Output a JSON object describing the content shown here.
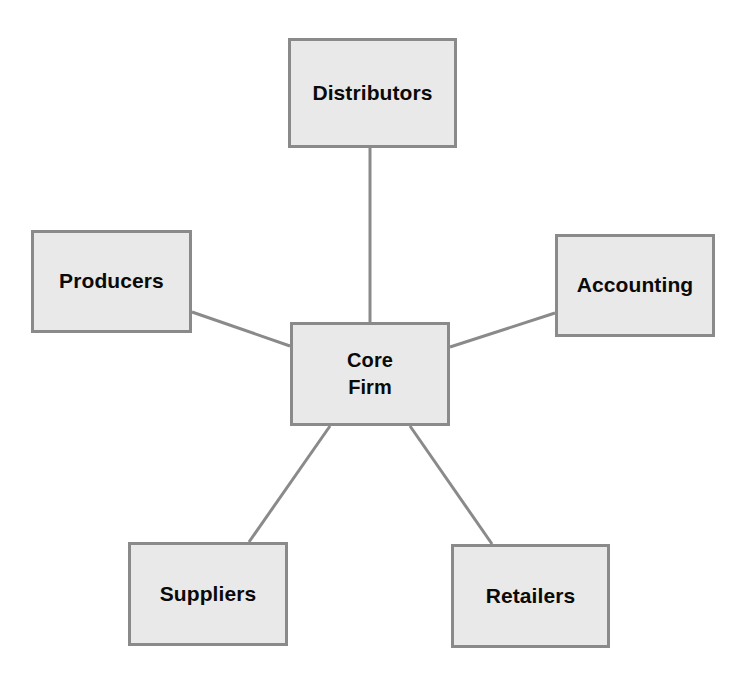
{
  "diagram": {
    "type": "hub-and-spoke network diagram",
    "background_color": "#ffffff",
    "node_fill_color": "#e9e9e9",
    "node_border_color": "#8a8a8a",
    "connector_color": "#8a8a8a",
    "text_color": "#0a0a0a",
    "nodes": [
      {
        "id": "distributors",
        "label": "Distributors",
        "x": 288,
        "y": 38,
        "width": 169,
        "height": 110
      },
      {
        "id": "producers",
        "label": "Producers",
        "x": 31,
        "y": 230,
        "width": 161,
        "height": 103
      },
      {
        "id": "accounting",
        "label": "Accounting",
        "x": 555,
        "y": 234,
        "width": 160,
        "height": 103
      },
      {
        "id": "core-firm",
        "label": "Core\nFirm",
        "x": 290,
        "y": 322,
        "width": 160,
        "height": 104
      },
      {
        "id": "suppliers",
        "label": "Suppliers",
        "x": 128,
        "y": 542,
        "width": 160,
        "height": 104
      },
      {
        "id": "retailers",
        "label": "Retailers",
        "x": 451,
        "y": 544,
        "width": 159,
        "height": 104
      }
    ],
    "connectors": [
      {
        "id": "core-firm-to-distributors",
        "from": "core-firm",
        "to": "distributors",
        "x1": 370,
        "y1": 322,
        "x2": 370,
        "y2": 148
      },
      {
        "id": "producers-to-core-firm",
        "from": "producers",
        "to": "core-firm",
        "x1": 192,
        "y1": 312,
        "x2": 290,
        "y2": 346
      },
      {
        "id": "core-firm-to-accounting",
        "from": "core-firm",
        "to": "accounting",
        "x1": 450,
        "y1": 347,
        "x2": 555,
        "y2": 313
      },
      {
        "id": "core-firm-to-suppliers",
        "from": "core-firm",
        "to": "suppliers",
        "x1": 330,
        "y1": 426,
        "x2": 249,
        "y2": 542
      },
      {
        "id": "core-firm-to-retailers",
        "from": "core-firm",
        "to": "retailers",
        "x1": 410,
        "y1": 426,
        "x2": 492,
        "y2": 544
      }
    ]
  }
}
